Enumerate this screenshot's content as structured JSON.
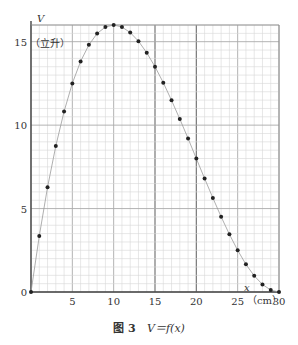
{
  "chart_data": {
    "type": "scatter",
    "caption_prefix": "图 3",
    "caption_formula": "V＝f(x)",
    "xlabel": "x",
    "xunit": "（cm）",
    "ylabel": "V",
    "yunit": "（立升）",
    "xlim": [
      0,
      30
    ],
    "ylim": [
      0,
      16
    ],
    "x_ticks": [
      0,
      5,
      10,
      15,
      20,
      25,
      30
    ],
    "x_tick_labels": [
      "5",
      "10",
      "15",
      "20",
      "25",
      "30"
    ],
    "y_ticks": [
      0,
      5,
      10,
      15
    ],
    "y_tick_labels": [
      "0",
      "5",
      "10",
      "15"
    ],
    "grid": true,
    "connected_by_curve": true,
    "series": [
      {
        "name": "V = f(x)",
        "x": [
          0,
          1,
          2,
          3,
          4,
          5,
          6,
          7,
          8,
          9,
          10,
          11,
          12,
          13,
          14,
          15,
          16,
          17,
          18,
          19,
          20,
          21,
          22,
          23,
          24,
          25,
          26,
          27,
          28,
          29,
          30
        ],
        "y": [
          0,
          3.36,
          6.27,
          8.75,
          10.82,
          12.5,
          13.82,
          14.81,
          15.49,
          15.88,
          16.0,
          15.88,
          15.55,
          15.03,
          14.34,
          13.5,
          12.54,
          11.49,
          10.37,
          9.2,
          8.0,
          6.8,
          5.63,
          4.51,
          3.46,
          2.5,
          1.66,
          0.97,
          0.45,
          0.12,
          0
        ]
      }
    ]
  }
}
